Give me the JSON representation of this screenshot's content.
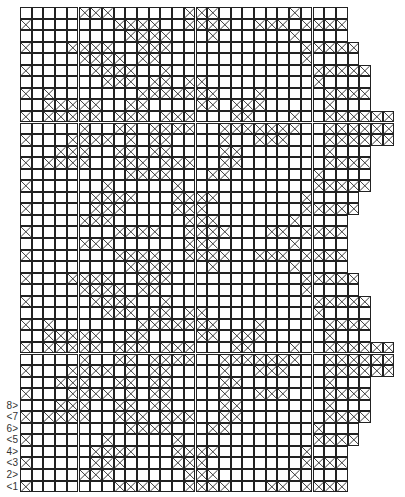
{
  "chart_title": "Filet crochet chart",
  "grid": {
    "rows": 42,
    "filled_symbol": "cross",
    "row_widths": [
      28,
      28,
      28,
      29,
      29,
      30,
      30,
      30,
      30,
      32,
      32,
      32,
      30,
      30,
      30,
      30,
      29,
      29,
      28,
      28,
      28,
      28,
      28,
      29,
      29,
      30,
      30,
      30,
      30,
      32,
      32,
      32,
      30,
      30,
      30,
      30,
      29,
      29,
      28,
      28,
      28,
      28
    ],
    "filled": [
      [
        5,
        6,
        7,
        14,
        15,
        16,
        23
      ],
      [
        0,
        8,
        9,
        10,
        11,
        14,
        15,
        16,
        17,
        20,
        21,
        22,
        24,
        25,
        26,
        27
      ],
      [
        9,
        10,
        11,
        12,
        16,
        23
      ],
      [
        0,
        4,
        5,
        6,
        7,
        10,
        11,
        12,
        24,
        25,
        26,
        27,
        28
      ],
      [
        5,
        6,
        7,
        8,
        10,
        11,
        24
      ],
      [
        0,
        6,
        7,
        8,
        9,
        12,
        25,
        26,
        27,
        28,
        29
      ],
      [
        7,
        8,
        9,
        11,
        12,
        14,
        15,
        25
      ],
      [
        0,
        2,
        10,
        11,
        12,
        13,
        14,
        15,
        16,
        20,
        26,
        27,
        28,
        29
      ],
      [
        2,
        3,
        4,
        5,
        6,
        9,
        10,
        15,
        16,
        18,
        19,
        20,
        26
      ],
      [
        0,
        2,
        3,
        4,
        5,
        6,
        8,
        9,
        10,
        12,
        13,
        14,
        18,
        19,
        23,
        26,
        27,
        28,
        29,
        30,
        31
      ],
      [
        5,
        8,
        9,
        11,
        12,
        13,
        14,
        17,
        18,
        19,
        20,
        21,
        22,
        23,
        26,
        27,
        28,
        29,
        30,
        31
      ],
      [
        0,
        4,
        5,
        6,
        7,
        9,
        11,
        12,
        17,
        20,
        21,
        22,
        26,
        27,
        28,
        29,
        30,
        31
      ],
      [
        3,
        4,
        5,
        8,
        9,
        11,
        12,
        17,
        18,
        26
      ],
      [
        0,
        2,
        3,
        4,
        5,
        8,
        9,
        10,
        12,
        13,
        14,
        17,
        18,
        26,
        27,
        28,
        29
      ],
      [
        9,
        10,
        11,
        12,
        16,
        17,
        25
      ],
      [
        0,
        7,
        13,
        25,
        26,
        27,
        28,
        29
      ],
      [
        6,
        7,
        8,
        9,
        13,
        14,
        15,
        16,
        24
      ],
      [
        0,
        6,
        7,
        8,
        13,
        14,
        15,
        24,
        25,
        26,
        27,
        28
      ],
      [
        5,
        6,
        7,
        14,
        15,
        16,
        23
      ],
      [
        0,
        8,
        9,
        10,
        11,
        14,
        15,
        16,
        17,
        21,
        22,
        24,
        25,
        26,
        27
      ],
      [
        5,
        6,
        7,
        14,
        15,
        16,
        23
      ],
      [
        0,
        8,
        9,
        10,
        11,
        14,
        15,
        16,
        17,
        20,
        21,
        22,
        24,
        25,
        26,
        27
      ],
      [
        9,
        10,
        11,
        12,
        16,
        23
      ],
      [
        0,
        4,
        5,
        6,
        7,
        10,
        11,
        12,
        24,
        25,
        26,
        27,
        28
      ],
      [
        5,
        6,
        7,
        8,
        10,
        11,
        24
      ],
      [
        0,
        6,
        7,
        8,
        9,
        12,
        25,
        26,
        27,
        28,
        29
      ],
      [
        7,
        8,
        9,
        11,
        12,
        14,
        15,
        25
      ],
      [
        0,
        2,
        10,
        11,
        12,
        13,
        14,
        15,
        16,
        20,
        26,
        27,
        28,
        29
      ],
      [
        2,
        3,
        4,
        5,
        6,
        9,
        10,
        15,
        16,
        18,
        19,
        20,
        26
      ],
      [
        0,
        2,
        3,
        4,
        5,
        6,
        8,
        9,
        10,
        12,
        13,
        14,
        18,
        19,
        23,
        26,
        27,
        28,
        29,
        30,
        31
      ],
      [
        5,
        8,
        9,
        11,
        12,
        13,
        14,
        17,
        18,
        19,
        20,
        21,
        22,
        23,
        26,
        27,
        28,
        29,
        30,
        31
      ],
      [
        0,
        4,
        5,
        6,
        7,
        9,
        11,
        12,
        17,
        20,
        21,
        22,
        26,
        27,
        28,
        29,
        30,
        31
      ],
      [
        3,
        4,
        5,
        8,
        9,
        11,
        12,
        17,
        18,
        26
      ],
      [
        0,
        4,
        5,
        6,
        7,
        9,
        11,
        12,
        17,
        20,
        21,
        22,
        26,
        27,
        28,
        29,
        30,
        31
      ],
      [
        3,
        4,
        5,
        8,
        9,
        11,
        12,
        17,
        18,
        26
      ],
      [
        0,
        2,
        3,
        4,
        5,
        8,
        9,
        10,
        12,
        13,
        14,
        17,
        18,
        26,
        27,
        28,
        29
      ],
      [
        9,
        10,
        11,
        12,
        16,
        17,
        25
      ],
      [
        0,
        7,
        13,
        25,
        26,
        27,
        28,
        29
      ],
      [
        6,
        7,
        8,
        9,
        13,
        14,
        15,
        16,
        24
      ],
      [
        0,
        6,
        7,
        8,
        13,
        14,
        15,
        24,
        25,
        26,
        27,
        28
      ],
      [
        5,
        6,
        7,
        14,
        15,
        16,
        23
      ],
      [
        0,
        8,
        9,
        10,
        11,
        14,
        15,
        16,
        17,
        21,
        22,
        24,
        25,
        26,
        27
      ]
    ]
  },
  "row_labels": [
    {
      "row": 1,
      "text": "<1"
    },
    {
      "row": 2,
      "text": "2>"
    },
    {
      "row": 3,
      "text": "<3"
    },
    {
      "row": 4,
      "text": "4>"
    },
    {
      "row": 5,
      "text": "<5"
    },
    {
      "row": 6,
      "text": "6>"
    },
    {
      "row": 7,
      "text": "<7"
    },
    {
      "row": 8,
      "text": "8>"
    }
  ],
  "colors": {
    "line": "#222222",
    "background": "#ffffff"
  }
}
